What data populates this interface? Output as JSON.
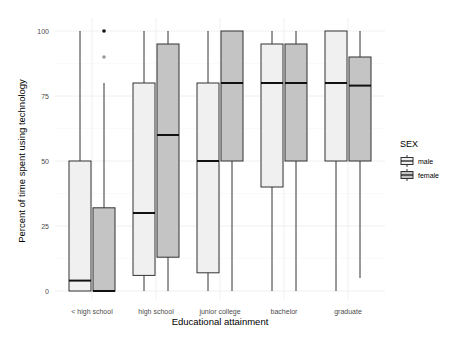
{
  "chart_data": {
    "type": "boxplot",
    "title": "",
    "xlabel": "Educational attainment",
    "ylabel": "Percent of time spent using technology",
    "ylim": [
      0,
      100
    ],
    "yticks": [
      0,
      25,
      50,
      75,
      100
    ],
    "grid": true,
    "legend": {
      "title": "SEX",
      "position": "right",
      "entries": [
        {
          "label": "male",
          "fill": "#f0f0f0"
        },
        {
          "label": "female",
          "fill": "#c4c4c4"
        }
      ]
    },
    "categories": [
      "< high school",
      "high school",
      "junior college",
      "bachelor",
      "graduate"
    ],
    "series": [
      {
        "name": "male",
        "fill": "#f0f0f0",
        "boxes": [
          {
            "min": 0,
            "q1": 0,
            "median": 4,
            "q3": 50,
            "max": 100,
            "outliers": []
          },
          {
            "min": 0,
            "q1": 6,
            "median": 30,
            "q3": 80,
            "max": 100,
            "outliers": []
          },
          {
            "min": 0,
            "q1": 7,
            "median": 50,
            "q3": 80,
            "max": 100,
            "outliers": []
          },
          {
            "min": 0,
            "q1": 40,
            "median": 80,
            "q3": 95,
            "max": 100,
            "outliers": []
          },
          {
            "min": 0,
            "q1": 50,
            "median": 80,
            "q3": 100,
            "max": 100,
            "outliers": []
          }
        ]
      },
      {
        "name": "female",
        "fill": "#c4c4c4",
        "boxes": [
          {
            "min": 0,
            "q1": 0,
            "median": 0,
            "q3": 32,
            "max": 80,
            "outliers": [
              100,
              90
            ]
          },
          {
            "min": 0,
            "q1": 13,
            "median": 60,
            "q3": 95,
            "max": 100,
            "outliers": []
          },
          {
            "min": 0,
            "q1": 50,
            "median": 80,
            "q3": 100,
            "max": 100,
            "outliers": []
          },
          {
            "min": 0,
            "q1": 50,
            "median": 80,
            "q3": 95,
            "max": 100,
            "outliers": []
          },
          {
            "min": 5,
            "q1": 50,
            "median": 79,
            "q3": 90,
            "max": 100,
            "outliers": []
          }
        ]
      }
    ]
  }
}
